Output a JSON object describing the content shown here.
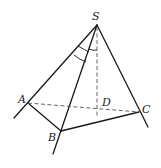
{
  "figure": {
    "type": "pyramid",
    "points": {
      "S": {
        "label": "S",
        "x": 97,
        "y": 25
      },
      "A": {
        "label": "A",
        "x": 28,
        "y": 103
      },
      "B": {
        "label": "B",
        "x": 61,
        "y": 131
      },
      "C": {
        "label": "C",
        "x": 139,
        "y": 112
      },
      "D": {
        "label": "D",
        "x": 97,
        "y": 108
      }
    },
    "solid_edges": [
      "SA",
      "SB",
      "SC",
      "AB",
      "BC"
    ],
    "dashed_edges": [
      "AC",
      "SD"
    ],
    "extended_rays": [
      "SA beyond A",
      "SB beyond B",
      "SC beyond C"
    ],
    "angle_marks": [
      {
        "at": "S",
        "between": [
          "SA",
          "SB"
        ],
        "arcs": 2
      },
      {
        "at": "S",
        "between": [
          "SB",
          "SD"
        ],
        "arcs": 1
      }
    ]
  },
  "labels": {
    "S": "S",
    "A": "A",
    "B": "B",
    "C": "C",
    "D": "D"
  }
}
